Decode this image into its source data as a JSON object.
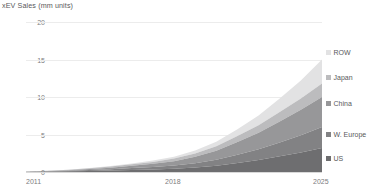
{
  "chart_data": {
    "type": "area",
    "title": "xEV Sales (mm units)",
    "xlabel": "",
    "ylabel": "",
    "stacked": true,
    "grid": true,
    "legend_position": "right",
    "xlim": [
      2011,
      2025
    ],
    "ylim": [
      0,
      20
    ],
    "yticks": [
      0,
      5,
      10,
      15,
      20
    ],
    "xticks": [
      2011,
      2018,
      2025
    ],
    "xtick_labels": [
      "2011",
      "2018",
      "2025"
    ],
    "ytick_labels": [
      "0",
      "5",
      "10",
      "15",
      "20"
    ],
    "x": [
      2011,
      2012,
      2013,
      2014,
      2015,
      2016,
      2017,
      2018,
      2019,
      2020,
      2021,
      2022,
      2023,
      2024,
      2025
    ],
    "series": [
      {
        "name": "US",
        "color": "#6e6e70",
        "values": [
          0.02,
          0.05,
          0.1,
          0.15,
          0.2,
          0.27,
          0.35,
          0.45,
          0.6,
          0.85,
          1.2,
          1.6,
          2.1,
          2.6,
          3.2
        ]
      },
      {
        "name": "W. Europe",
        "color": "#828284",
        "values": [
          0.02,
          0.04,
          0.07,
          0.12,
          0.18,
          0.25,
          0.32,
          0.42,
          0.58,
          0.8,
          1.1,
          1.45,
          1.85,
          2.3,
          2.8
        ]
      },
      {
        "name": "China",
        "color": "#979799",
        "values": [
          0.01,
          0.03,
          0.06,
          0.12,
          0.2,
          0.3,
          0.42,
          0.58,
          0.85,
          1.2,
          1.7,
          2.2,
          2.8,
          3.4,
          4.0
        ]
      },
      {
        "name": "Japan",
        "color": "#bcbcbe",
        "values": [
          0.02,
          0.04,
          0.06,
          0.1,
          0.14,
          0.2,
          0.26,
          0.34,
          0.45,
          0.6,
          0.8,
          1.0,
          1.25,
          1.5,
          1.8
        ]
      },
      {
        "name": "ROW",
        "color": "#e2e2e3",
        "values": [
          0.0,
          0.01,
          0.02,
          0.04,
          0.07,
          0.11,
          0.17,
          0.25,
          0.4,
          0.6,
          0.9,
          1.3,
          1.8,
          2.4,
          3.2
        ]
      }
    ],
    "totals": [
      0.07,
      0.17,
      0.31,
      0.53,
      0.79,
      1.13,
      1.52,
      2.04,
      2.88,
      4.05,
      5.7,
      7.55,
      9.8,
      12.2,
      15.0
    ],
    "legend": [
      {
        "label": "ROW",
        "color": "#e2e2e3"
      },
      {
        "label": "Japan",
        "color": "#bcbcbe"
      },
      {
        "label": "China",
        "color": "#979799"
      },
      {
        "label": "W. Europe",
        "color": "#828284"
      },
      {
        "label": "US",
        "color": "#6e6e70"
      }
    ],
    "legend_y": [
      49,
      74,
      100,
      131,
      155
    ],
    "gridline_color": "#ececec",
    "axis_color": "#d9d9d9",
    "text_color": "#58585a",
    "tick_color": "#7c7c7e",
    "background": "#ffffff"
  }
}
